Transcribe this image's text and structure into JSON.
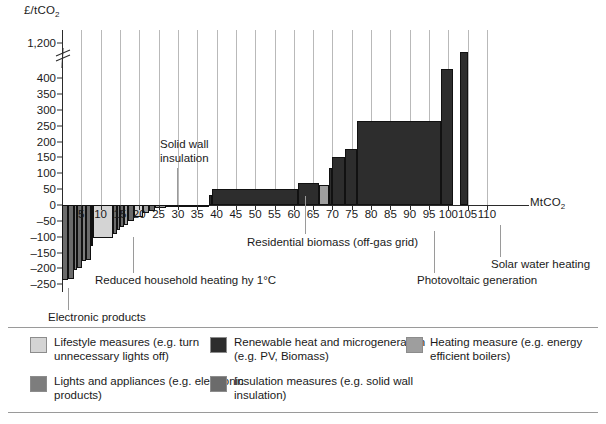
{
  "chart_data": {
    "type": "bar",
    "title": "",
    "subtitle": "",
    "xlabel": "MtCO2",
    "ylabel": "£/tCO2",
    "xlim": [
      0,
      110
    ],
    "ylim": [
      -250,
      400
    ],
    "y_axis_break": {
      "below": 400,
      "above": 1200,
      "note": "axis broken between 400 and 1,200"
    },
    "yticks": [
      "1,200",
      "400",
      "350",
      "300",
      "250",
      "200",
      "150",
      "100",
      "50",
      "0",
      "–50",
      "–100",
      "–150",
      "–200",
      "–250"
    ],
    "ytick_values": [
      1200,
      400,
      350,
      300,
      250,
      200,
      150,
      100,
      50,
      0,
      -50,
      -100,
      -150,
      -200,
      -250
    ],
    "xticks": [
      "5",
      "10",
      "15",
      "20",
      "25",
      "30",
      "35",
      "40",
      "45",
      "50",
      "55",
      "60",
      "65",
      "70",
      "75",
      "80",
      "85",
      "90",
      "95",
      "100",
      "105",
      "110"
    ],
    "xtick_values": [
      5,
      10,
      15,
      20,
      25,
      30,
      35,
      40,
      45,
      50,
      55,
      60,
      65,
      70,
      75,
      80,
      85,
      90,
      95,
      100,
      105,
      110
    ],
    "grid": "vertical light gridlines at 5 MtCO2 intervals",
    "legend_position": "below plot",
    "note": "Marginal abatement cost curve: bar width = abatement potential (MtCO2), bar height = cost (£/tCO2)",
    "bars": [
      {
        "x0": 0.0,
        "x1": 1.6,
        "value": -238,
        "category": "insulation"
      },
      {
        "x0": 1.6,
        "x1": 3.0,
        "value": -232,
        "category": "insulation"
      },
      {
        "x0": 3.0,
        "x1": 4.0,
        "value": -205,
        "category": "lights-appliances"
      },
      {
        "x0": 4.0,
        "x1": 5.3,
        "value": -200,
        "category": "insulation"
      },
      {
        "x0": 5.3,
        "x1": 6.2,
        "value": -178,
        "category": "lights-appliances"
      },
      {
        "x0": 6.2,
        "x1": 7.4,
        "value": -172,
        "category": "insulation"
      },
      {
        "x0": 7.4,
        "x1": 8.1,
        "value": -130,
        "category": "lights-appliances"
      },
      {
        "x0": 8.1,
        "x1": 13.2,
        "value": -105,
        "category": "lifestyle"
      },
      {
        "x0": 13.2,
        "x1": 14.2,
        "value": -92,
        "category": "insulation"
      },
      {
        "x0": 14.2,
        "x1": 15.0,
        "value": -80,
        "category": "lights-appliances"
      },
      {
        "x0": 15.0,
        "x1": 16.0,
        "value": -70,
        "category": "insulation"
      },
      {
        "x0": 16.0,
        "x1": 17.0,
        "value": -62,
        "category": "heating"
      },
      {
        "x0": 17.0,
        "x1": 18.6,
        "value": -52,
        "category": "insulation"
      },
      {
        "x0": 18.6,
        "x1": 21.0,
        "value": -38,
        "category": "lifestyle"
      },
      {
        "x0": 21.0,
        "x1": 22.4,
        "value": -26,
        "category": "heating"
      },
      {
        "x0": 22.4,
        "x1": 24.0,
        "value": -18,
        "category": "insulation"
      },
      {
        "x0": 24.0,
        "x1": 27.0,
        "value": -10,
        "category": "heating"
      },
      {
        "x0": 27.0,
        "x1": 38.0,
        "value": -4,
        "category": "insulation"
      },
      {
        "x0": 38.0,
        "x1": 38.7,
        "value": 30,
        "category": "renewable"
      },
      {
        "x0": 38.7,
        "x1": 61.0,
        "value": 50,
        "category": "renewable"
      },
      {
        "x0": 61.0,
        "x1": 66.6,
        "value": 70,
        "category": "renewable"
      },
      {
        "x0": 66.6,
        "x1": 69.2,
        "value": 62,
        "category": "heating"
      },
      {
        "x0": 69.2,
        "x1": 70.0,
        "value": 118,
        "category": "renewable"
      },
      {
        "x0": 70.0,
        "x1": 73.2,
        "value": 150,
        "category": "renewable"
      },
      {
        "x0": 73.2,
        "x1": 76.3,
        "value": 178,
        "category": "renewable"
      },
      {
        "x0": 76.3,
        "x1": 98.0,
        "value": 265,
        "category": "renewable"
      },
      {
        "x0": 98.0,
        "x1": 101.2,
        "value": 430,
        "category": "renewable"
      },
      {
        "x0": 103.0,
        "x1": 105.0,
        "value": 440,
        "category": "renewable",
        "clipped": true,
        "clipped_note": "bar extends beyond axis break toward 1,200"
      }
    ],
    "annotations": [
      {
        "text": "Solid wall insulation",
        "points_to_x": 30
      },
      {
        "text": "Residential biomass (off-gas grid)",
        "points_to_x": 52
      },
      {
        "text": "Reduced household heating hy 1°C",
        "points_to_x": 10
      },
      {
        "text": "Electronic products",
        "points_to_x": 3
      },
      {
        "text": "Photovoltaic generation",
        "points_to_x": 87
      },
      {
        "text": "Solar water heating",
        "points_to_x": 104
      }
    ]
  },
  "legend": {
    "items": [
      {
        "label": "Lifestyle measures (e.g. turn unnecessary lights off)",
        "key": "lifestyle",
        "color": "#d4d4d4"
      },
      {
        "label": "Lights and appliances (e.g. electronic products)",
        "key": "lights-appliances",
        "color": "#7d7d7d"
      },
      {
        "label": "Renewable heat and microgeneration (e.g. PV, Biomass)",
        "key": "renewable",
        "color": "#2d2d2d"
      },
      {
        "label": "Insulation measures (e.g. solid wall insulation)",
        "key": "insulation",
        "color": "#6b6b6b"
      },
      {
        "label": "Heating measure (e.g. energy efficient boilers)",
        "key": "heating",
        "color": "#9e9e9e"
      }
    ]
  },
  "axis_labels": {
    "y_title": "£/tCO",
    "y_title_sub": "2",
    "x_title": "MtCO",
    "x_title_sub": "2"
  }
}
